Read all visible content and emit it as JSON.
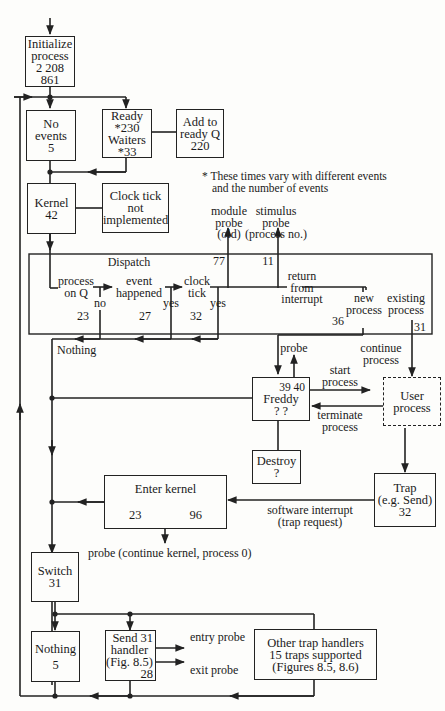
{
  "diagram": {
    "boxes": {
      "initialize": {
        "lines": [
          "Initialize",
          "process",
          "2 208 861"
        ]
      },
      "no_events": {
        "lines": [
          "No",
          "events",
          "5"
        ]
      },
      "ready_waiters": {
        "lines": [
          "Ready",
          "*230",
          "Waiters",
          "*33"
        ]
      },
      "add_ready_q": {
        "lines": [
          "Add to",
          "ready Q",
          "220"
        ]
      },
      "kernel": {
        "lines": [
          "Kernel",
          "42"
        ]
      },
      "clock_tick_ni": {
        "lines": [
          "Clock tick",
          "not",
          "implemented"
        ]
      },
      "dispatch": {
        "title": "Dispatch"
      },
      "freddy": {
        "top_left": "39",
        "top_right": "40",
        "name": "Freddy",
        "bottom": "?  ?"
      },
      "user_process": {
        "lines": [
          "User",
          "process"
        ]
      },
      "destroy": {
        "lines": [
          "Destroy",
          "?"
        ]
      },
      "trap": {
        "lines": [
          "Trap",
          "(e.g. Send)",
          "32"
        ]
      },
      "enter_kernel": {
        "title": "Enter kernel",
        "left": "23",
        "right": "96"
      },
      "switch": {
        "lines": [
          "Switch",
          "31"
        ]
      },
      "nothing": {
        "lines": [
          "Nothing",
          "5"
        ]
      },
      "send_handler": {
        "lines": [
          "Send 31",
          "handler",
          "(Fig. 8.5)",
          "28"
        ]
      },
      "other_traps": {
        "lines": [
          "Other trap handlers",
          "15 traps supported",
          "(Figures 8.5, 8.6)"
        ]
      }
    },
    "notes": {
      "footnote": [
        "* These times vary with different events",
        "and the number of events"
      ],
      "module_probe": [
        "module",
        "probe",
        "(old)"
      ],
      "stimulus_probe": [
        "stimulus",
        "probe",
        "(process no.)"
      ],
      "val_77": "77",
      "val_11": "11",
      "process_on_q": [
        "process",
        "on Q"
      ],
      "event_happened": [
        "event",
        "happened"
      ],
      "clock_tick": [
        "clock",
        "tick"
      ],
      "no": "no",
      "yes1": "yes",
      "yes2": "yes",
      "val_23": "23",
      "val_27": "27",
      "val_32": "32",
      "return_from_interrupt": [
        "return",
        "from",
        "interrupt"
      ],
      "new_process": [
        "new",
        "process"
      ],
      "existing_process": [
        "existing",
        "process"
      ],
      "val_36": "36",
      "val_31": "31",
      "nothing": "Nothing",
      "probe": "probe",
      "continue_process": [
        "continue",
        "process"
      ],
      "start_process": [
        "start",
        "process"
      ],
      "terminate_process": [
        "terminate",
        "process"
      ],
      "software_interrupt": [
        "software interrupt",
        "(trap request)"
      ],
      "probe_continue_kernel": "probe (continue kernel, process 0)",
      "entry_probe": "entry probe",
      "exit_probe": "exit probe"
    }
  }
}
